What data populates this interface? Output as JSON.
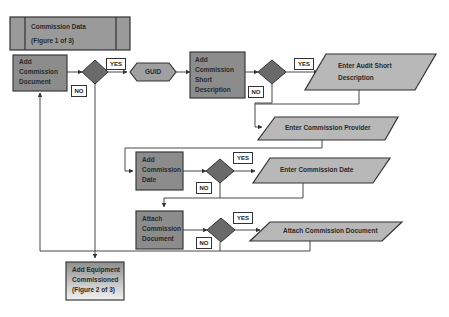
{
  "diagram": {
    "header": {
      "line1": "Commission Data",
      "line2": "(Figure 1 of 3)"
    },
    "processes": {
      "add_doc": [
        "Add",
        "Commission",
        "Document"
      ],
      "guid": "GUID",
      "add_short": [
        "Add",
        "Commission",
        "Short",
        "Description"
      ],
      "add_date": [
        "Add",
        "Commission",
        "Date"
      ],
      "attach_doc": [
        "Attach",
        "Commission",
        "Document"
      ],
      "equipment": [
        "Add Equipment",
        "Commissioned",
        "(Figure 2 of 3)"
      ]
    },
    "inputs": {
      "audit_short": [
        "Enter Audit Short",
        "Description"
      ],
      "provider": "Enter Commission Provider",
      "date": "Enter Commission Date",
      "attach": "Attach Commission Document"
    },
    "labels": {
      "yes": "YES",
      "no": "NO"
    },
    "colors": {
      "process_fill": "#8c8c8c",
      "process_border": "#3a3a3a",
      "decision_fill": "#6a6a6a",
      "io_fill": "#b8b8b8",
      "header_fill": "#9a9a9a",
      "line": "#333333"
    }
  }
}
